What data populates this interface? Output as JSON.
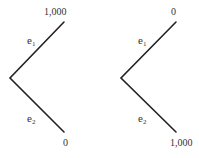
{
  "trees": [
    {
      "name": "left",
      "branches": [
        {
          "event": "e",
          "subscript": "1",
          "payoff": "1,000"
        },
        {
          "event": "e",
          "subscript": "2",
          "payoff": "0"
        }
      ]
    },
    {
      "name": "right",
      "branches": [
        {
          "event": "e",
          "subscript": "1",
          "payoff": "0"
        },
        {
          "event": "e",
          "subscript": "2",
          "payoff": "1,000"
        }
      ]
    }
  ],
  "colors": {
    "line": "#222222",
    "text": "#333333"
  }
}
